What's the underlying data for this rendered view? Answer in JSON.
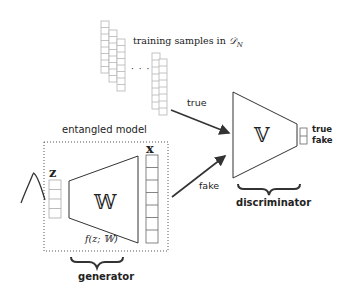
{
  "diagram": {
    "training_label": "training samples in 𝒟_N",
    "training_label_main": "training samples in ",
    "training_label_math": "𝒟",
    "training_label_sub": "N",
    "ellipsis": "· · ·",
    "edge_true": "true",
    "edge_fake": "fake",
    "entangled_label": "entangled model",
    "z_label": "z",
    "x_label": "x",
    "generator_symbol": "𝕎",
    "generator_func": "f(z; 𝕎)",
    "generator_label": "generator",
    "discriminator_symbol": "𝕍",
    "discriminator_label": "discriminator",
    "output_true": "true",
    "output_fake": "fake"
  },
  "colors": {
    "line": "#333333",
    "box_light": "#b0b0b0",
    "text": "#222222"
  }
}
